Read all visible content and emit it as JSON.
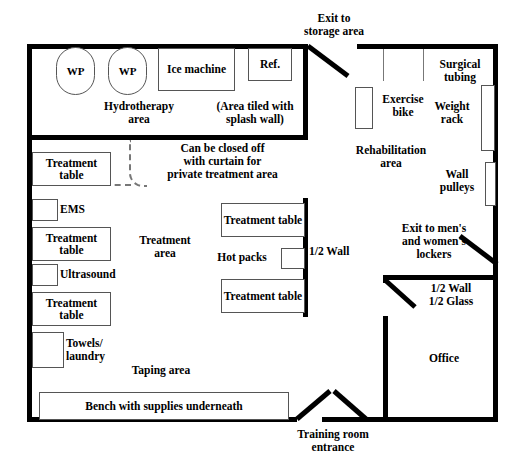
{
  "diagram": {
    "colors": {
      "wall": "#000000",
      "equipment_outline": "#555555",
      "curtain": "#777777",
      "background": "#ffffff"
    }
  },
  "hydrotherapy": {
    "area_label": "Hydrotherapy\narea",
    "tiled_note": "(Area tiled with\nsplash wall)",
    "whirlpool_1": "WP",
    "whirlpool_2": "WP",
    "ice_machine": "Ice\nmachine",
    "refrigerator": "Ref."
  },
  "treatment": {
    "curtain_note": "Can be closed off\nwith curtain for\nprivate treatment area",
    "area_label": "Treatment\narea",
    "taping_area_label": "Taping area",
    "hot_packs": "Hot packs",
    "half_wall": "1/2 Wall",
    "tables": [
      {
        "label": "Treatment\ntable"
      },
      {
        "label": "Treatment\ntable"
      },
      {
        "label": "Treatment\ntable"
      },
      {
        "label": "Treatment\ntable"
      },
      {
        "label": "Treatment\ntable"
      }
    ],
    "modalities": [
      {
        "label": "EMS"
      },
      {
        "label": "Ultrasound"
      },
      {
        "label": "Towels/\nlaundry"
      }
    ],
    "bench": "Bench with supplies underneath"
  },
  "rehabilitation": {
    "area_label": "Rehabilitation\narea",
    "exercise_bike": "Exercise\nbike",
    "surgical_tubing": "Surgical\ntubing",
    "weight_rack": "Weight\nrack",
    "wall_pulleys": "Wall\npulleys"
  },
  "office": {
    "label": "Office",
    "wall_note": "1/2 Wall\n1/2 Glass"
  },
  "exits": {
    "storage": "Exit to\nstorage area",
    "lockers": "Exit to men's\nand women's\nlockers",
    "entrance": "Training room\nentrance"
  }
}
